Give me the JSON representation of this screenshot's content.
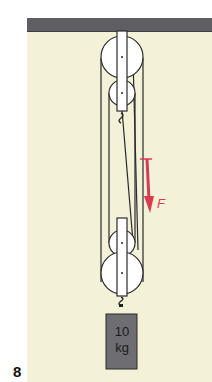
{
  "figure": {
    "number": "8"
  },
  "mass": {
    "value_line1": "10",
    "value_line2": "kg"
  },
  "force": {
    "label": "F",
    "vector_arrow": "→",
    "color": "#d93c52"
  },
  "colors": {
    "background": "#f3f1d8",
    "ceiling": "#5f5f63",
    "mass_block": "#6e6e72",
    "rope": "#2b2b2b"
  }
}
